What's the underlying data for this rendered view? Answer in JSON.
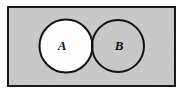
{
  "figure": {
    "name": "venn-diagram-two-sets",
    "type": "venn",
    "width": 183,
    "height": 95,
    "page_background": "#ffffff"
  },
  "universal_set": {
    "shape": "rectangle",
    "label": "",
    "fill": "#c9c9c9",
    "stroke": "#1a1a1a",
    "stroke_width": 2,
    "x": 8,
    "y": 7,
    "width": 167,
    "height": 79
  },
  "sets": [
    {
      "id": "A",
      "label": "A",
      "shape": "circle",
      "cx": 66,
      "cy": 46,
      "r": 26.5,
      "fill": "#fdfdfd",
      "stroke": "#111111",
      "stroke_width": 2,
      "label_x": 62,
      "label_y": 50
    },
    {
      "id": "B",
      "label": "B",
      "shape": "circle",
      "cx": 118,
      "cy": 46,
      "r": 26,
      "fill": "none",
      "stroke": "#111111",
      "stroke_width": 2,
      "label_x": 119,
      "label_y": 50
    }
  ],
  "intersection": {
    "name": "A-intersect-B",
    "fill": "#fdfdfd",
    "shaded": true
  },
  "colors": {
    "background_gray": "#c9c9c9",
    "ink": "#111111",
    "circle_fill": "#fdfdfd",
    "page": "#ffffff"
  }
}
